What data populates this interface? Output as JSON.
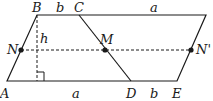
{
  "diagram": {
    "type": "geometry",
    "points": {
      "A": {
        "label": "A",
        "x": 7,
        "y": 81
      },
      "B": {
        "label": "B",
        "x": 37,
        "y": 15
      },
      "C": {
        "label": "C",
        "x": 79,
        "y": 15
      },
      "F": {
        "label": "",
        "x": 206,
        "y": 15
      },
      "D": {
        "label": "D",
        "x": 131,
        "y": 81
      },
      "E": {
        "label": "E",
        "x": 177,
        "y": 81
      },
      "N": {
        "label": "N",
        "x": 21,
        "y": 50
      },
      "M": {
        "label": "M",
        "x": 105,
        "y": 50
      },
      "Np": {
        "label": "N'",
        "x": 191,
        "y": 50
      }
    },
    "segment_labels": {
      "BC": "b",
      "CF": "a",
      "AD": "a",
      "DE": "b",
      "height": "h"
    },
    "colors": {
      "line": "#1a1a1a",
      "background": "#ffffff"
    }
  }
}
